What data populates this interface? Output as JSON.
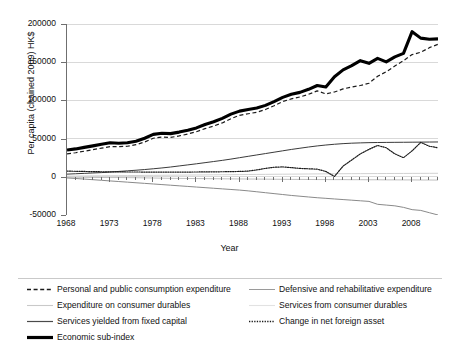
{
  "chart_data": {
    "type": "line",
    "title": "",
    "xlabel": "Year",
    "ylabel": "Per capita (chained 2009) HK$",
    "xlim": [
      1968,
      2011
    ],
    "ylim": [
      -50000,
      200000
    ],
    "grid": true,
    "legend_position": "bottom",
    "y_ticks": [
      "200000",
      "150000",
      "100000",
      "50000",
      "0",
      "-50000"
    ],
    "y_tick_values": [
      200000,
      150000,
      100000,
      50000,
      0,
      -50000
    ],
    "x_ticks": [
      "1968",
      "1973",
      "1978",
      "1983",
      "1988",
      "1993",
      "1998",
      "2003",
      "2008"
    ],
    "x_tick_values": [
      1968,
      1973,
      1978,
      1983,
      1988,
      1993,
      1998,
      2003,
      2008
    ],
    "x": [
      1968,
      1969,
      1970,
      1971,
      1972,
      1973,
      1974,
      1975,
      1976,
      1977,
      1978,
      1979,
      1980,
      1981,
      1982,
      1983,
      1984,
      1985,
      1986,
      1987,
      1988,
      1989,
      1990,
      1991,
      1992,
      1993,
      1994,
      1995,
      1996,
      1997,
      1998,
      1999,
      2000,
      2001,
      2002,
      2003,
      2004,
      2005,
      2006,
      2007,
      2008,
      2009,
      2010,
      2011
    ],
    "series": [
      {
        "name": "Economic sub-index",
        "style": "solid-thick-black",
        "color": "#000000",
        "width": 3.1,
        "values": [
          35000,
          36500,
          38500,
          40500,
          42500,
          44500,
          44000,
          44500,
          46500,
          50500,
          55500,
          57000,
          56500,
          58500,
          61000,
          64000,
          68500,
          72000,
          76500,
          82000,
          86000,
          88000,
          90000,
          93500,
          98500,
          104000,
          108000,
          110500,
          114500,
          119500,
          117500,
          131000,
          140000,
          145500,
          152000,
          148500,
          155000,
          150500,
          157000,
          161500,
          190000,
          181500,
          180000,
          180500
        ]
      },
      {
        "name": "Personal and public consumption expenditure",
        "style": "dashed",
        "color": "#1a1a1a",
        "width": 1.2,
        "values": [
          30000,
          31500,
          33500,
          35500,
          37500,
          39500,
          39500,
          40000,
          42000,
          45500,
          50500,
          52000,
          51500,
          53500,
          56000,
          59000,
          63000,
          66500,
          70500,
          76000,
          80500,
          82500,
          84500,
          88000,
          93000,
          98500,
          102000,
          104500,
          108000,
          112500,
          108500,
          111000,
          115000,
          117500,
          119500,
          122500,
          131500,
          137500,
          145000,
          152000,
          160000,
          163000,
          169000,
          173500
        ]
      },
      {
        "name": "Services yielded from fixed capital",
        "style": "solid-thin-dark",
        "color": "#3a3a3a",
        "width": 1.0,
        "values": [
          3500,
          4000,
          4500,
          5000,
          5500,
          6200,
          7000,
          7800,
          8600,
          9500,
          10500,
          11600,
          12800,
          14200,
          15600,
          17000,
          18500,
          20000,
          21500,
          23200,
          25000,
          26800,
          28600,
          30400,
          32200,
          34000,
          35800,
          37400,
          39000,
          40400,
          41600,
          42600,
          43400,
          44000,
          44400,
          44700,
          44900,
          45000,
          45100,
          45200,
          45300,
          45400,
          45500,
          45600
        ]
      },
      {
        "name": "Change in net foreign asset",
        "style": "dotted",
        "color": "#1a1a1a",
        "width": 1.2,
        "values": [
          7500,
          7200,
          7000,
          6800,
          6600,
          6500,
          6400,
          6300,
          6300,
          6200,
          6200,
          6200,
          6200,
          6200,
          6200,
          6300,
          6400,
          6500,
          6600,
          6800,
          7000,
          7500,
          9000,
          11000,
          12500,
          13000,
          12000,
          11000,
          10500,
          10000,
          7000,
          500,
          14000,
          22000,
          30000,
          36000,
          41000,
          38000,
          30000,
          25000,
          34000,
          45000,
          40000,
          38000
        ]
      },
      {
        "name": "Defensive and rehabilitative expenditure",
        "style": "solid-thin-gray",
        "color": "#8a8a8a",
        "width": 1.0,
        "values": [
          -1500,
          -2200,
          -3000,
          -3800,
          -4600,
          -5400,
          -6200,
          -7000,
          -7800,
          -8600,
          -9400,
          -10200,
          -11000,
          -11800,
          -12600,
          -13400,
          -14200,
          -15000,
          -15800,
          -16600,
          -17400,
          -18400,
          -19600,
          -20800,
          -22000,
          -23200,
          -24400,
          -25400,
          -26400,
          -27400,
          -28200,
          -29000,
          -29800,
          -30600,
          -31400,
          -32200,
          -36000,
          -37000,
          -38000,
          -40000,
          -43000,
          -44000,
          -47000,
          -50000
        ]
      },
      {
        "name": "Expenditure on consumer durables",
        "style": "solid-verylight",
        "color": "#bfbfbf",
        "width": 1.0,
        "values": [
          -500,
          -600,
          -700,
          -800,
          -900,
          -1000,
          -1000,
          -1100,
          -1200,
          -1400,
          -1600,
          -1800,
          -2000,
          -2100,
          -2200,
          -2300,
          -2400,
          -2500,
          -2600,
          -2700,
          -2800,
          -2900,
          -3000,
          -3100,
          -3200,
          -3300,
          -3400,
          -3400,
          -3500,
          -3600,
          -3600,
          -3700,
          -3700,
          -3800,
          -3800,
          -3900,
          -3900,
          -4000,
          -4000,
          -4100,
          -4100,
          -4200,
          -4200,
          -4300
        ]
      },
      {
        "name": "Services from consumer durables",
        "style": "solid-verylight",
        "color": "#d2d2d2",
        "width": 1.0,
        "values": [
          900,
          1000,
          1100,
          1200,
          1300,
          1400,
          1500,
          1600,
          1700,
          1800,
          1900,
          2000,
          2100,
          2200,
          2300,
          2400,
          2500,
          2600,
          2700,
          2800,
          2900,
          3000,
          3100,
          3200,
          3300,
          3400,
          3500,
          3600,
          3700,
          3800,
          3900,
          4000,
          4050,
          4100,
          4150,
          4200,
          4250,
          4300,
          4350,
          4400,
          4450,
          4500,
          4550,
          4600
        ]
      }
    ]
  },
  "legend": {
    "items": [
      {
        "label": "Personal and public consumption expenditure",
        "key": "dashed"
      },
      {
        "label": "Defensive and rehabilitative expenditure",
        "key": "solid-thin-gray"
      },
      {
        "label": "Expenditure on consumer durables",
        "key": "solid-verylight"
      },
      {
        "label": "Services from consumer durables",
        "key": "solid-verylight-2"
      },
      {
        "label": "Services yielded from fixed capital",
        "key": "solid-thin-dark"
      },
      {
        "label": "Change in net foreign asset",
        "key": "dotted"
      },
      {
        "label": "Economic sub-index",
        "key": "solid-thick-black"
      }
    ]
  },
  "colors": {
    "axis": "#6f6f6f",
    "grid": "#d9d9d9",
    "text": "#111111",
    "thick_line": "#000000",
    "gray_line": "#8a8a8a",
    "light_line": "#c9c9c9"
  }
}
